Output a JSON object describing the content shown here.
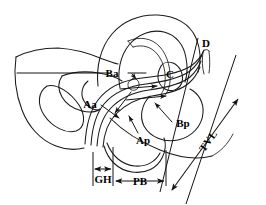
{
  "figure": {
    "background_color": "#ffffff",
    "line_color": "#1a1a1a",
    "text_color": "#000000",
    "width": 266,
    "height": 205
  },
  "labels": {
    "ba": "Ba",
    "aa": "Aa",
    "c": "C",
    "d": "D",
    "bp": "Bp",
    "ap": "Ap",
    "gh": "GH",
    "pb": "PB",
    "tvl": "TVL"
  },
  "measurements": [
    {
      "id": "gh",
      "label": "GH",
      "kind": "horizontal-double-arrow"
    },
    {
      "id": "pb",
      "label": "PB",
      "kind": "horizontal-double-arrow"
    },
    {
      "id": "tvl",
      "label": "TVL",
      "kind": "diagonal-double-arrow"
    }
  ],
  "point_labels": [
    {
      "id": "aa",
      "label": "Aa",
      "kind": "leader-arrow"
    },
    {
      "id": "ba",
      "label": "Ba",
      "kind": "leader-arrow"
    },
    {
      "id": "ap",
      "label": "Ap",
      "kind": "leader-arrow"
    },
    {
      "id": "bp",
      "label": "Bp",
      "kind": "leader-arrow"
    },
    {
      "id": "c",
      "label": "C",
      "kind": "plain"
    },
    {
      "id": "d",
      "label": "D",
      "kind": "plain"
    }
  ]
}
